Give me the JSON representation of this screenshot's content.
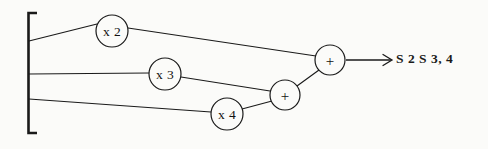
{
  "figure": {
    "background_color": "#fbfbf9",
    "ink_color": "#1a1a1a"
  },
  "input_bracket": {
    "name": "input-bracket",
    "description": "Vertical brace grouping the three input signals",
    "x": 28,
    "y_top": 12,
    "y_bottom": 134,
    "serif_length": 9
  },
  "nodes": [
    {
      "id": "mult-x2",
      "label": "x 2",
      "type": "multiplier",
      "cx": 112,
      "cy": 31,
      "r": 16
    },
    {
      "id": "mult-x3",
      "label": "x 3",
      "type": "multiplier",
      "cx": 165,
      "cy": 74,
      "r": 16
    },
    {
      "id": "mult-x4",
      "label": "x 4",
      "type": "multiplier",
      "cx": 227,
      "cy": 114,
      "r": 16
    },
    {
      "id": "adder-lower",
      "label": "+",
      "type": "adder",
      "cx": 285,
      "cy": 95,
      "r": 15
    },
    {
      "id": "adder-upper",
      "label": "+",
      "type": "adder",
      "cx": 330,
      "cy": 60,
      "r": 15
    }
  ],
  "edges": [
    {
      "id": "edge-in1-to-x2",
      "from": "input-1",
      "to": "mult-x2",
      "x1": 29,
      "y1": 41,
      "x2": 97,
      "y2": 24
    },
    {
      "id": "edge-in2-to-x3",
      "from": "input-2",
      "to": "mult-x3",
      "x1": 29,
      "y1": 74,
      "x2": 149,
      "y2": 73
    },
    {
      "id": "edge-in3-to-x4",
      "from": "input-3",
      "to": "mult-x4",
      "x1": 29,
      "y1": 99,
      "x2": 211,
      "y2": 112
    },
    {
      "id": "edge-x2-to-adder-u",
      "from": "mult-x2",
      "to": "adder-upper",
      "x1": 128,
      "y1": 28,
      "x2": 316,
      "y2": 56
    },
    {
      "id": "edge-x3-to-adder-l",
      "from": "mult-x3",
      "to": "adder-lower",
      "x1": 181,
      "y1": 77,
      "x2": 270,
      "y2": 91
    },
    {
      "id": "edge-x4-to-adder-l",
      "from": "mult-x4",
      "to": "adder-lower",
      "x1": 242,
      "y1": 109,
      "x2": 272,
      "y2": 100
    },
    {
      "id": "edge-adder-l-to-u",
      "from": "adder-lower",
      "to": "adder-upper",
      "x1": 297,
      "y1": 86,
      "x2": 318,
      "y2": 70
    }
  ],
  "output_arrow": {
    "name": "output-arrow",
    "x1": 346,
    "y1": 60,
    "x2": 392,
    "y2": 60
  },
  "output_label": {
    "name": "output-label",
    "text": "S 2 S 3, 4"
  }
}
